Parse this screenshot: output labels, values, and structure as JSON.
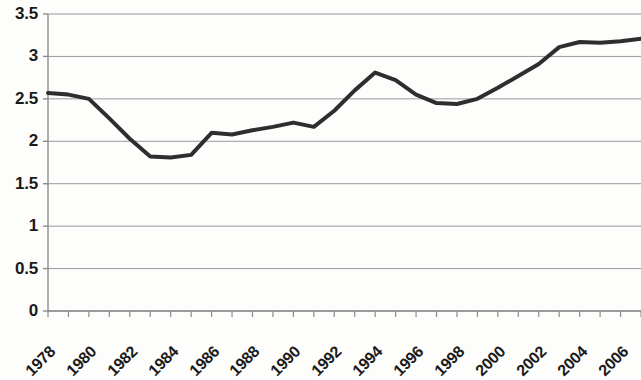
{
  "chart_data": {
    "type": "line",
    "title": "",
    "subtitle": "",
    "xlabel": "",
    "ylabel": "",
    "x": [
      1978,
      1979,
      1980,
      1981,
      1982,
      1983,
      1984,
      1985,
      1986,
      1987,
      1988,
      1989,
      1990,
      1991,
      1992,
      1993,
      1994,
      1995,
      1996,
      1997,
      1998,
      1999,
      2000,
      2001,
      2002,
      2003,
      2004,
      2005,
      2006,
      2007
    ],
    "values": [
      2.57,
      2.55,
      2.5,
      2.27,
      2.03,
      1.82,
      1.81,
      1.84,
      2.1,
      2.08,
      2.13,
      2.17,
      2.22,
      2.17,
      2.36,
      2.6,
      2.81,
      2.72,
      2.55,
      2.45,
      2.44,
      2.5,
      2.63,
      2.77,
      2.91,
      3.11,
      3.17,
      3.16,
      3.18,
      3.21
    ],
    "series": [
      {
        "name": "series-1",
        "color": "#2e2e2e",
        "values": [
          2.57,
          2.55,
          2.5,
          2.27,
          2.03,
          1.82,
          1.81,
          1.84,
          2.1,
          2.08,
          2.13,
          2.17,
          2.22,
          2.17,
          2.36,
          2.6,
          2.81,
          2.72,
          2.55,
          2.45,
          2.44,
          2.5,
          2.63,
          2.77,
          2.91,
          3.11,
          3.17,
          3.16,
          3.18,
          3.21
        ]
      }
    ],
    "ylim": [
      0,
      3.5
    ],
    "xlim": [
      1978,
      2007
    ],
    "ytick_labels": [
      "0",
      "0.5",
      "1",
      "1.5",
      "2",
      "2.5",
      "3",
      "3.5"
    ],
    "ytick_values": [
      0,
      0.5,
      1,
      1.5,
      2,
      2.5,
      3,
      3.5
    ],
    "xtick_labels": [
      "1978",
      "1980",
      "1982",
      "1984",
      "1986",
      "1988",
      "1990",
      "1992",
      "1994",
      "1996",
      "1998",
      "2000",
      "2002",
      "2004",
      "2006"
    ],
    "xtick_values": [
      1978,
      1980,
      1982,
      1984,
      1986,
      1988,
      1990,
      1992,
      1994,
      1996,
      1998,
      2000,
      2002,
      2004,
      2006
    ],
    "xtick_minor_values": [
      1978,
      1979,
      1980,
      1981,
      1982,
      1983,
      1984,
      1985,
      1986,
      1987,
      1988,
      1989,
      1990,
      1991,
      1992,
      1993,
      1994,
      1995,
      1996,
      1997,
      1998,
      1999,
      2000,
      2001,
      2002,
      2003,
      2004,
      2005,
      2006,
      2007
    ],
    "grid": true,
    "grid_axis": "y",
    "grid_color": "#9a9a9a",
    "axis_color": "#8c8c8c",
    "legend": false,
    "legend_position": "none",
    "markers": false,
    "line_width": 4,
    "annotations": []
  }
}
